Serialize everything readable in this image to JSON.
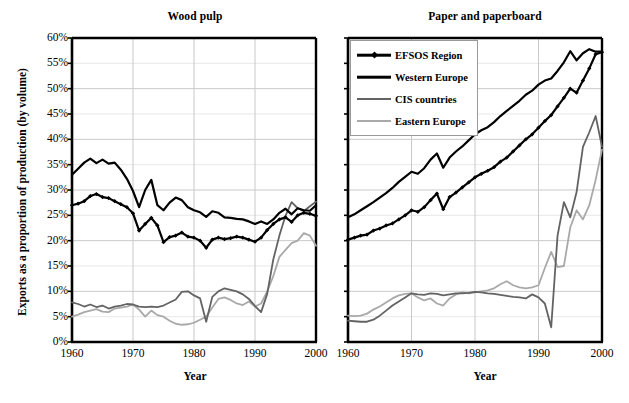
{
  "figure": {
    "y_axis_title": "Exports as a proportion of production (by volume)",
    "y_ticks": [
      "60%",
      "55%",
      "50%",
      "45%",
      "40%",
      "35%",
      "30%",
      "25%",
      "20%",
      "15%",
      "10%",
      "5%",
      "0%"
    ],
    "x_ticks": [
      "1960",
      "1970",
      "1980",
      "1990",
      "2000"
    ],
    "x_axis_title_left": "Year",
    "x_axis_title_right": "Year"
  },
  "legend": {
    "position": "top-left of right panel",
    "items": [
      {
        "label": "EFSOS Region",
        "color": "#000000",
        "marker": "diamond",
        "width": 2.2
      },
      {
        "label": "Western Europe",
        "color": "#000000",
        "marker": "none",
        "width": 2.2
      },
      {
        "label": "CIS countries",
        "color": "#636363",
        "marker": "none",
        "width": 1.8
      },
      {
        "label": "Eastern Europe",
        "color": "#a9a9a9",
        "marker": "none",
        "width": 1.8
      }
    ]
  },
  "chart_data": [
    {
      "type": "line",
      "title": "Wood pulp",
      "xlabel": "Year",
      "ylabel": "Exports as a proportion of production (by volume)",
      "xlim": [
        1960,
        2000
      ],
      "ylim": [
        0,
        60
      ],
      "ytick_step": 5,
      "grid": "horizontal-10-and-decades",
      "x": [
        1960,
        1961,
        1962,
        1963,
        1964,
        1965,
        1966,
        1967,
        1968,
        1969,
        1970,
        1971,
        1972,
        1973,
        1974,
        1975,
        1976,
        1977,
        1978,
        1979,
        1980,
        1981,
        1982,
        1983,
        1984,
        1985,
        1986,
        1987,
        1988,
        1989,
        1990,
        1991,
        1992,
        1993,
        1994,
        1995,
        1996,
        1997,
        1998,
        1999,
        2000
      ],
      "series": [
        {
          "name": "EFSOS Region",
          "color": "#000000",
          "values": [
            27.0,
            27.3,
            27.8,
            28.8,
            29.2,
            28.6,
            28.4,
            27.8,
            27.2,
            26.6,
            25.4,
            22.0,
            23.3,
            24.5,
            23.0,
            19.7,
            20.7,
            21.0,
            21.6,
            20.8,
            20.6,
            20.0,
            18.6,
            20.2,
            20.6,
            20.3,
            20.5,
            20.8,
            20.6,
            20.2,
            19.8,
            20.6,
            22.1,
            23.3,
            24.2,
            24.6,
            23.7,
            25.0,
            25.5,
            25.3,
            24.9
          ]
        },
        {
          "name": "Western Europe",
          "color": "#000000",
          "values": [
            33.0,
            34.2,
            35.4,
            36.2,
            35.3,
            36.0,
            35.2,
            35.4,
            34.0,
            32.2,
            29.8,
            26.6,
            30.0,
            32.0,
            27.0,
            26.0,
            27.5,
            28.5,
            28.0,
            26.6,
            26.0,
            25.6,
            24.7,
            25.8,
            25.5,
            24.6,
            24.5,
            24.3,
            24.2,
            23.8,
            23.3,
            23.8,
            23.3,
            24.2,
            25.5,
            26.3,
            25.2,
            26.4,
            26.0,
            25.9,
            27.0
          ]
        },
        {
          "name": "CIS countries",
          "color": "#636363",
          "values": [
            7.8,
            7.5,
            7.0,
            7.4,
            6.9,
            7.2,
            6.6,
            7.0,
            7.2,
            7.5,
            7.4,
            7.0,
            6.9,
            7.0,
            6.9,
            7.2,
            7.8,
            8.4,
            9.9,
            10.0,
            9.2,
            8.6,
            4.0,
            8.9,
            10.0,
            10.6,
            10.3,
            10.0,
            9.4,
            8.5,
            7.1,
            5.9,
            9.5,
            16.3,
            21.0,
            24.9,
            27.6,
            26.4,
            25.8,
            26.8,
            27.7
          ]
        },
        {
          "name": "Eastern Europe",
          "color": "#a9a9a9",
          "values": [
            5.0,
            5.4,
            5.9,
            6.2,
            6.5,
            6.0,
            5.9,
            6.6,
            6.8,
            7.0,
            7.4,
            6.4,
            5.0,
            6.2,
            5.3,
            5.0,
            4.2,
            3.6,
            3.4,
            3.5,
            3.8,
            4.4,
            5.0,
            6.8,
            8.5,
            8.8,
            8.3,
            7.6,
            7.3,
            8.0,
            7.0,
            7.6,
            10.0,
            13.0,
            16.8,
            18.2,
            19.5,
            20.0,
            21.5,
            21.0,
            19.0
          ]
        }
      ]
    },
    {
      "type": "line",
      "title": "Paper and paperboard",
      "xlabel": "Year",
      "ylabel": "Exports as a proportion of production (by volume)",
      "xlim": [
        1960,
        2000
      ],
      "ylim": [
        0,
        60
      ],
      "ytick_step": 5,
      "grid": "horizontal-10-and-decades",
      "x": [
        1960,
        1961,
        1962,
        1963,
        1964,
        1965,
        1966,
        1967,
        1968,
        1969,
        1970,
        1971,
        1972,
        1973,
        1974,
        1975,
        1976,
        1977,
        1978,
        1979,
        1980,
        1981,
        1982,
        1983,
        1984,
        1985,
        1986,
        1987,
        1988,
        1989,
        1990,
        1991,
        1992,
        1993,
        1994,
        1995,
        1996,
        1997,
        1998,
        1999,
        2000
      ],
      "series": [
        {
          "name": "EFSOS Region",
          "color": "#000000",
          "values": [
            20.2,
            20.6,
            21.0,
            21.2,
            22.0,
            22.4,
            23.0,
            23.4,
            24.2,
            25.0,
            26.0,
            25.7,
            26.6,
            28.0,
            29.3,
            26.2,
            28.6,
            29.5,
            30.5,
            31.5,
            32.5,
            33.2,
            33.8,
            34.5,
            35.6,
            36.4,
            37.6,
            38.8,
            40.0,
            41.0,
            42.3,
            43.6,
            44.8,
            46.5,
            48.2,
            50.0,
            49.2,
            51.6,
            54.0,
            56.8,
            57.2
          ]
        },
        {
          "name": "Western Europe",
          "color": "#000000",
          "values": [
            24.6,
            25.2,
            26.0,
            26.8,
            27.6,
            28.5,
            29.4,
            30.4,
            31.6,
            32.6,
            33.6,
            33.2,
            34.3,
            36.0,
            37.2,
            34.4,
            36.4,
            37.6,
            38.6,
            39.8,
            41.0,
            41.8,
            42.4,
            43.4,
            44.6,
            45.6,
            46.6,
            47.6,
            48.8,
            49.6,
            50.8,
            51.6,
            52.0,
            53.5,
            55.2,
            57.4,
            55.6,
            57.0,
            57.8,
            57.3,
            57.3
          ]
        },
        {
          "name": "CIS countries",
          "color": "#636363",
          "values": [
            4.2,
            4.1,
            4.0,
            4.0,
            4.4,
            5.2,
            6.2,
            7.2,
            8.0,
            8.8,
            9.6,
            9.4,
            9.3,
            9.6,
            9.5,
            9.2,
            9.4,
            9.6,
            9.6,
            9.7,
            9.9,
            9.8,
            9.6,
            9.5,
            9.3,
            9.1,
            8.9,
            8.8,
            8.6,
            9.4,
            8.8,
            7.6,
            2.9,
            21.0,
            27.6,
            24.6,
            29.6,
            38.5,
            41.4,
            44.6,
            38.5
          ]
        },
        {
          "name": "Eastern Europe",
          "color": "#a9a9a9",
          "values": [
            5.2,
            5.1,
            5.2,
            5.6,
            6.4,
            7.0,
            7.8,
            8.6,
            9.2,
            9.5,
            9.6,
            8.8,
            8.2,
            8.6,
            7.6,
            7.2,
            8.6,
            9.4,
            9.8,
            9.6,
            9.8,
            10.0,
            10.2,
            10.6,
            11.4,
            12.0,
            11.2,
            10.8,
            10.6,
            10.8,
            11.2,
            14.6,
            17.8,
            14.8,
            15.0,
            22.6,
            26.0,
            24.2,
            27.0,
            32.0,
            38.0
          ]
        }
      ]
    }
  ]
}
